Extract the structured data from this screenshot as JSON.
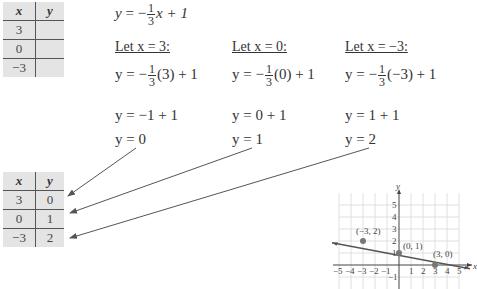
{
  "table_empty": {
    "headers": [
      "x",
      "y"
    ],
    "rows": [
      [
        "3",
        ""
      ],
      [
        "0",
        ""
      ],
      [
        "−3",
        ""
      ]
    ]
  },
  "equation": {
    "lhs": "y",
    "eq": "=",
    "sign": "−",
    "num": "1",
    "den": "3",
    "rest": "x + 1"
  },
  "columns": [
    {
      "let_label": "Let x = 3:",
      "step1_arg": "(3) + 1",
      "step2": "y = −1 + 1",
      "result": "y = 0"
    },
    {
      "let_label": "Let x = 0:",
      "step1_arg": "(0) + 1",
      "step2": "y = 0 + 1",
      "result": "y = 1"
    },
    {
      "let_label": "Let x = −3:",
      "step1_arg": "(−3) + 1",
      "step2": "y = 1 + 1",
      "result": "y = 2"
    }
  ],
  "step1_prefix": "y = −",
  "table_filled": {
    "headers": [
      "x",
      "y"
    ],
    "rows": [
      [
        "3",
        "0"
      ],
      [
        "0",
        "1"
      ],
      [
        "−3",
        "2"
      ]
    ]
  },
  "graph": {
    "x_label": "x",
    "y_label": "y",
    "x_ticks": [
      "−5",
      "−4",
      "−3",
      "−2",
      "−1",
      "1",
      "2",
      "3",
      "4",
      "5"
    ],
    "y_ticks": [
      "5",
      "4",
      "3",
      "2",
      "1",
      "−1"
    ],
    "points": [
      {
        "label": "(−3, 2)",
        "x": -3,
        "y": 2
      },
      {
        "label": "(0, 1)",
        "x": 0,
        "y": 1
      },
      {
        "label": "(3, 0)",
        "x": 3,
        "y": 0
      }
    ],
    "line_color": "#555555",
    "point_color": "#777777"
  }
}
